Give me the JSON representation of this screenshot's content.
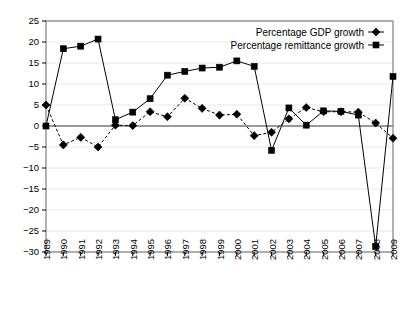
{
  "chart_data": {
    "type": "line",
    "title": "",
    "xlabel": "",
    "ylabel": "",
    "ylim": [
      -30,
      25
    ],
    "ytick_step": 5,
    "grid": true,
    "legend_position": "top-right",
    "categories": [
      "1989",
      "1990",
      "1991",
      "1992",
      "1993",
      "1994",
      "1995",
      "1996",
      "1997",
      "1998",
      "1999",
      "2000",
      "2001",
      "2002",
      "2003",
      "2004",
      "2005",
      "2006",
      "2007",
      "2008",
      "2009"
    ],
    "series": [
      {
        "name": "Percentage GDP growth",
        "marker": "diamond",
        "linestyle": "dashed",
        "color": "#000000",
        "values": [
          5.0,
          -4.5,
          -2.7,
          -5.0,
          0.2,
          0.1,
          3.4,
          2.2,
          6.6,
          4.2,
          2.6,
          2.8,
          -2.3,
          -1.5,
          1.7,
          4.4,
          3.4,
          3.4,
          3.3,
          0.7,
          -2.9
        ]
      },
      {
        "name": "Percentage remittance growth",
        "marker": "square",
        "linestyle": "solid",
        "color": "#000000",
        "values": [
          0.0,
          18.4,
          19.0,
          20.7,
          1.5,
          3.3,
          6.5,
          12.1,
          13.0,
          13.8,
          14.0,
          15.5,
          14.2,
          -5.8,
          4.3,
          0.2,
          3.6,
          3.5,
          2.6,
          -28.7,
          11.8
        ]
      }
    ],
    "ytick_labels": [
      "25",
      "20",
      "15",
      "10",
      "5",
      "0",
      "-5",
      "-10",
      "-15",
      "-20",
      "-25",
      "-30"
    ],
    "axis_color": "#808080",
    "grid_color": "#e8e8e8"
  },
  "legend": {
    "entries": [
      {
        "label": "Percentage GDP growth",
        "marker": "diamond"
      },
      {
        "label": "Percentage remittance growth",
        "marker": "square"
      }
    ]
  }
}
